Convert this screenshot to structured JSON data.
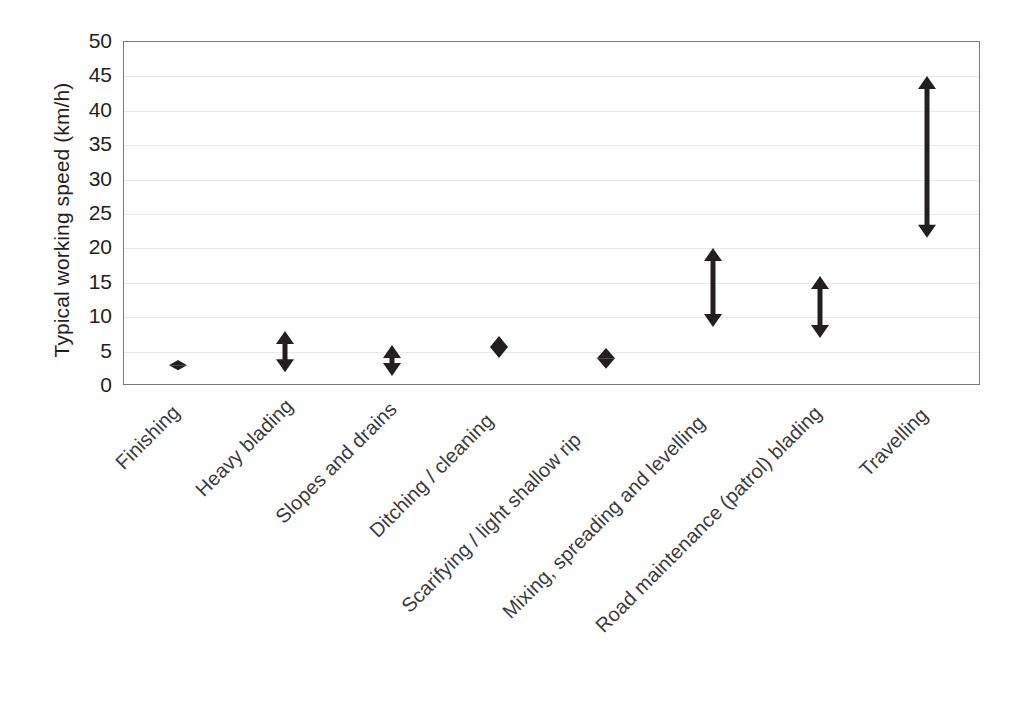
{
  "chart_data": {
    "type": "bar",
    "subtype": "range-bars-with-double-arrow-markers",
    "title": "",
    "xlabel": "",
    "ylabel": "Typical working speed (km/h)",
    "ylim": [
      0,
      50
    ],
    "ytick_step": 5,
    "yticks": [
      "50",
      "45",
      "40",
      "35",
      "30",
      "25",
      "20",
      "15",
      "10",
      "5",
      "0"
    ],
    "grid": "horizontal",
    "legend": "none",
    "marker_color": "#231f20",
    "categories": [
      "Finishing",
      "Heavy blading",
      "Slopes and drains",
      "Ditching / cleaning",
      "Scarifying / light shallow rip",
      "Mixing, spreading and levelling",
      "Road maintenance (patrol) blading",
      "Travelling"
    ],
    "low": [
      2.3,
      2.0,
      1.5,
      4.0,
      2.5,
      8.5,
      7.0,
      21.5
    ],
    "high": [
      3.8,
      8.0,
      6.0,
      7.2,
      5.5,
      20.0,
      16.0,
      45.0
    ],
    "series": [
      {
        "name": "Typical working speed range (km/h)",
        "points": [
          {
            "category": "Finishing",
            "low": 2.3,
            "high": 3.8
          },
          {
            "category": "Heavy blading",
            "low": 2.0,
            "high": 8.0
          },
          {
            "category": "Slopes and drains",
            "low": 1.5,
            "high": 6.0
          },
          {
            "category": "Ditching / cleaning",
            "low": 4.0,
            "high": 7.2
          },
          {
            "category": "Scarifying / light shallow rip",
            "low": 2.5,
            "high": 5.5
          },
          {
            "category": "Mixing, spreading and levelling",
            "low": 8.5,
            "high": 20.0
          },
          {
            "category": "Road maintenance (patrol) blading",
            "low": 7.0,
            "high": 16.0
          },
          {
            "category": "Travelling",
            "low": 21.5,
            "high": 45.0
          }
        ]
      }
    ]
  },
  "axis": {
    "y_title": "Typical working speed (km/h)"
  }
}
